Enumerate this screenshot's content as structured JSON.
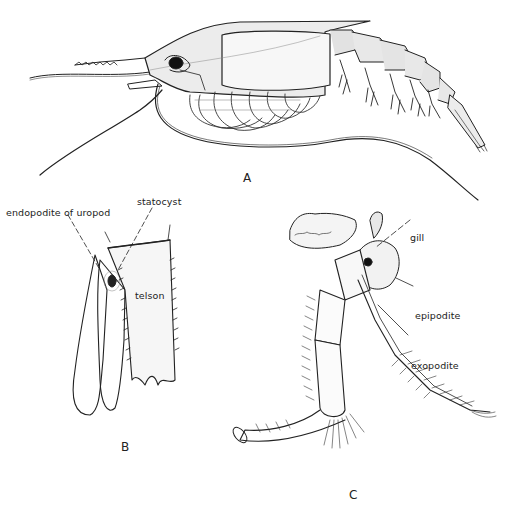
{
  "figure": {
    "panels": [
      {
        "id": "A",
        "label": "A",
        "subject": "whole animal, lateral view"
      },
      {
        "id": "B",
        "label": "B",
        "subject": "tail fan"
      },
      {
        "id": "C",
        "label": "C",
        "subject": "thoracic limb"
      }
    ],
    "labels": {
      "endopodite": "endopodite of uropod",
      "statocyst": "statocyst",
      "telson": "telson",
      "gill": "gill",
      "epipodite": "epipodite",
      "exopodite": "exopodite"
    },
    "colors": {
      "ink": "#222222",
      "shade": "#bdbdbd",
      "background": "#ffffff"
    }
  }
}
